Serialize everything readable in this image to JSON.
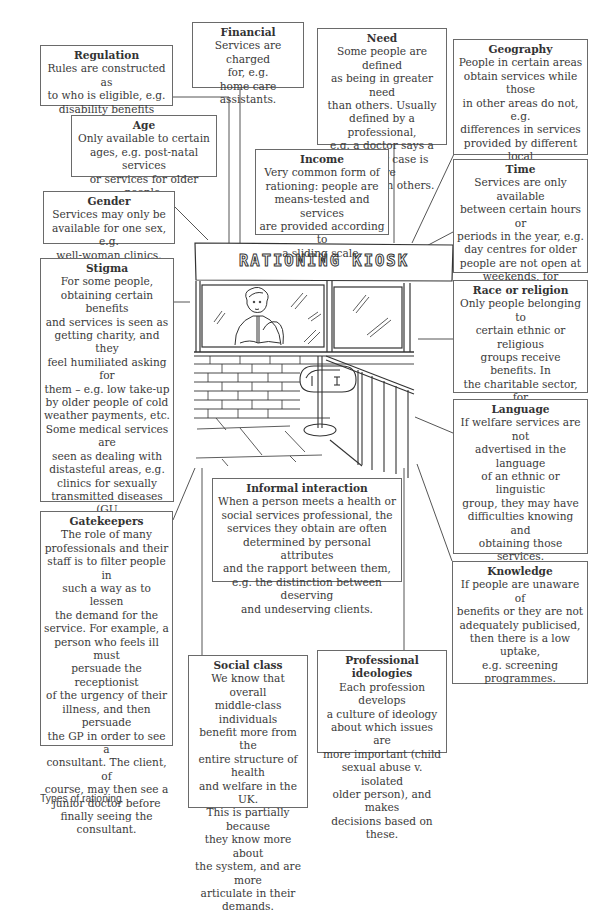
{
  "figure": {
    "caption": "Types of rationing",
    "kiosk_sign": "RATIONING KIOSK"
  },
  "boxes": {
    "regulation": {
      "title": "Regulation",
      "text": "Rules are constructed as\nto who is eligible, e.g.\ndisability benefits"
    },
    "financial": {
      "title": "Financial",
      "text": "Services are charged\nfor, e.g.\nhome care assistants."
    },
    "need": {
      "title": "Need",
      "text": "Some people are defined\nas being in greater need\nthan others. Usually\ndefined by a professional,\ne.g. a doctor says a\nparticular case is more\nurgent than others."
    },
    "geography": {
      "title": "Geography",
      "text": "People in certain areas\nobtain services while those\nin other areas do not, e.g.\ndifferences in services\nprovided by different local\nauthorities and health\nauthorities."
    },
    "age": {
      "title": "Age",
      "text": "Only available to certain\nages, e.g. post-natal services\nor services for older people."
    },
    "income": {
      "title": "Income",
      "text": "Very common form of\nrationing: people are\nmeans-tested and services\nare provided according to\na sliding scale."
    },
    "gender": {
      "title": "Gender",
      "text": "Services may only be\navailable for one sex, e.g.\nwell-woman clinics."
    },
    "time": {
      "title": "Time",
      "text": "Services are only available\nbetween certain hours or\nperiods in the year, e.g.\nday centres for older\npeople are not open at\nweekends, for\nstaffing reasons."
    },
    "stigma": {
      "title": "Stigma",
      "text": "For some people,\nobtaining certain benefits\nand services is seen as\ngetting charity, and they\nfeel humiliated asking for\nthem – e.g. low take-up\nby older people of cold\nweather payments, etc.\nSome medical services are\nseen as dealing with\ndistasteful areas, e.g.\nclinics for sexually\ntransmitted diseases (GU\nclinics). Patients are\nreluctant to attend until\nthey are desperate."
    },
    "race_religion": {
      "title": "Race or religion",
      "text": "Only people belonging to\ncertain ethnic or religious\ngroups receive benefits. In\nthe charitable sector, for\nexample, Jewish and\nCatholic welfare\norganisations."
    },
    "language": {
      "title": "Language",
      "text": "If welfare services are not\nadvertised in the language\nof an ethnic or linguistic\ngroup, they may have\ndifficulties knowing and\nobtaining those services.\nThe NHS and DSS\ntherefore provide leaflets\nin a wide variety of\nlanguages."
    },
    "informal_interaction": {
      "title": "Informal interaction",
      "text": "When a person meets a health or\nsocial services professional, the\nservices they obtain are often\ndetermined by personal attributes\nand the rapport between them,\ne.g. the distinction between deserving\nand undeserving clients."
    },
    "gatekeepers": {
      "title": "Gatekeepers",
      "text": "The role of many\nprofessionals and their\nstaff is to filter people in\nsuch a way as to lessen\nthe demand for the\nservice. For example, a\nperson who feels ill must\npersuade the receptionist\nof the urgency of their\nillness, and then persuade\nthe GP in order to see a\nconsultant. The client, of\ncourse, may then see a\njunior doctor before\nfinally seeing the\nconsultant."
    },
    "knowledge": {
      "title": "Knowledge",
      "text": "If people are unaware of\nbenefits or they are not\nadequately publicised,\nthen there is a low\nuptake,\ne.g. screening\nprogrammes."
    },
    "social_class": {
      "title": "Social class",
      "text": "We know that overall\nmiddle-class individuals\nbenefit more from the\nentire structure of health\nand welfare in the UK.\nThis is partially because\nthey know more about\nthe system, and are more\narticulate in their\ndemands."
    },
    "professional_ideologies": {
      "title": "Professional ideologies",
      "text": "Each profession develops\na culture of ideology\nabout which issues are\nmore important (child\nsexual abuse v. isolated\nolder person), and makes\ndecisions based on these."
    }
  }
}
